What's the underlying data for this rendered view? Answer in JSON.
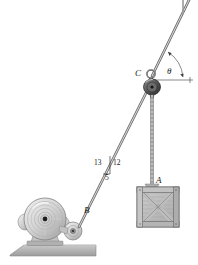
{
  "figure": {
    "background_color": "#ffffff",
    "ink_color": "#1a1a1a",
    "metal_light": "#e2e2e2",
    "metal_mid": "#b9b9b9",
    "metal_dark": "#7a7a7a",
    "ground_color": "#b5b5b5",
    "crate_color": "#bdbdbd",
    "cable_color": "#8a8a8a"
  },
  "labels": {
    "point_a": "A",
    "point_b": "B",
    "point_c": "C",
    "angle_theta": "θ",
    "slope_hyp": "13",
    "slope_vert": "12",
    "slope_horiz": "5"
  },
  "geometry": {
    "pulley_c": {
      "x": 152,
      "y": 80
    },
    "drum_center": {
      "x": 45,
      "y": 219
    },
    "idler_center": {
      "x": 73,
      "y": 231
    },
    "point_b": {
      "x": 80,
      "y": 228
    },
    "crate": {
      "x": 137,
      "y": 187,
      "w": 42,
      "h": 40
    },
    "upper_cable_end": {
      "x": 190,
      "y": 0
    },
    "horizontal_ref_end": {
      "x": 193,
      "y": 80
    },
    "theta_degrees_visual": 62,
    "incline_slope_rise": 12,
    "incline_slope_run": 5,
    "incline_slope_hyp": 13
  },
  "parts": [
    {
      "name": "winch-drum",
      "description": "Large grooved cable drum on pedestal base"
    },
    {
      "name": "idler-pulley",
      "description": "Small guide sheave at point B"
    },
    {
      "name": "ground-wedge",
      "description": "Sloped gray ground platform"
    },
    {
      "name": "incline-cable",
      "description": "Cable from B up to pulley C along 5-12-13 slope"
    },
    {
      "name": "upper-cable",
      "description": "Cable from C up-right to overhead anchor at angle theta"
    },
    {
      "name": "hoist-chain",
      "description": "Vertical chain from pulley block down to crate A"
    },
    {
      "name": "crate-a",
      "description": "Wooden crate with X cross-bracing"
    },
    {
      "name": "shackle-ring",
      "description": "Ring / shackle at C above pulley block"
    },
    {
      "name": "slope-triangle",
      "description": "5-12-13 slope triangle marker on incline cable"
    },
    {
      "name": "horizontal-reference",
      "description": "Horizontal datum line through C for angle theta"
    }
  ]
}
